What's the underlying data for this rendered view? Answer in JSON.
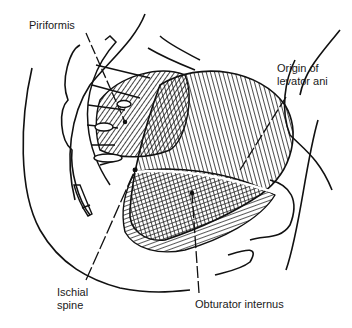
{
  "figure": {
    "line_color": "#111111",
    "background": "#ffffff"
  },
  "labels": {
    "piriformis": "Piriformis",
    "origin_levator_line1": "Origin of",
    "origin_levator_line2": "levator ani",
    "ischial_line1": "Ischial",
    "ischial_line2": "spine",
    "obturator": "Obturator internus"
  }
}
